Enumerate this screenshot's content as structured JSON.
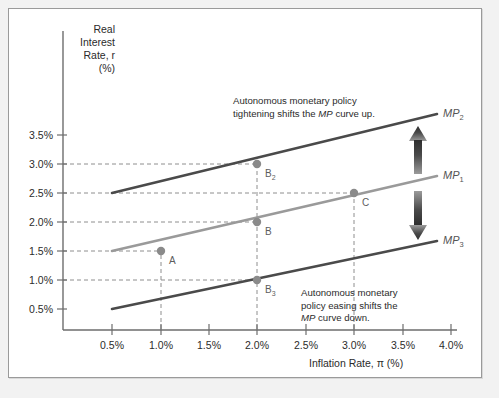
{
  "figure": {
    "y_axis_title": "Real\nInterest\nRate, r\n(%)",
    "x_axis_title": "Inflation Rate, π (%)"
  },
  "annotations": {
    "tighten": "Autonomous monetary policy\ntightening shifts the MP curve up.",
    "ease": "Autonomous monetary\npolicy easing shifts the\nMP curve down."
  },
  "curve_labels": {
    "mp2": "MP",
    "mp2_sub": "2",
    "mp1": "MP",
    "mp1_sub": "1",
    "mp3": "MP",
    "mp3_sub": "3"
  },
  "point_labels": {
    "a": "A",
    "b": "B",
    "b2": "B",
    "b2_sub": "2",
    "b3": "B",
    "b3_sub": "3",
    "c": "C"
  },
  "colors": {
    "mp1": "#9a9a9a",
    "mp2": "#4a4a4a",
    "mp3": "#4a4a4a",
    "axis": "#6d6d6d",
    "grid": "#8e8e8e",
    "marker": "#8a8a8a",
    "arrow": "#3a3a3a",
    "frame": "#9a9a9a",
    "page_background": "#f2f2f2",
    "plot_background": "#ffffff"
  },
  "chart_data": {
    "type": "line",
    "title": "",
    "xlabel": "Inflation Rate, π (%)",
    "ylabel": "Real Interest Rate, r (%)",
    "xlim": [
      0.25,
      4.25
    ],
    "ylim": [
      0.1,
      3.9
    ],
    "grid": "dashed horizontal and vertical guide lines to labeled points",
    "legend": "inline curve labels at right end of each line",
    "x_ticks": [
      "0.5%",
      "1.0%",
      "1.5%",
      "2.0%",
      "2.5%",
      "3.0%",
      "3.5%",
      "4.0%"
    ],
    "x_tick_values": [
      0.5,
      1.0,
      1.5,
      2.0,
      2.5,
      3.0,
      3.5,
      4.0
    ],
    "y_ticks": [
      "0.5%",
      "1.0%",
      "1.5%",
      "2.0%",
      "2.5%",
      "3.0%",
      "3.5%"
    ],
    "y_tick_values": [
      0.5,
      1.0,
      1.5,
      2.0,
      2.5,
      3.0,
      3.5
    ],
    "series": [
      {
        "name": "MP2",
        "label": "MP₂",
        "color": "#4a4a4a",
        "description": "Monetary policy curve after autonomous tightening (shifted up)",
        "x": [
          0.5,
          3.8
        ],
        "y": [
          2.25,
          3.85
        ]
      },
      {
        "name": "MP1",
        "label": "MP₁",
        "color": "#9a9a9a",
        "description": "Original monetary policy curve",
        "x": [
          0.5,
          3.8
        ],
        "y": [
          1.25,
          2.85
        ]
      },
      {
        "name": "MP3",
        "label": "MP₃",
        "color": "#4a4a4a",
        "description": "Monetary policy curve after autonomous easing (shifted down)",
        "x": [
          0.5,
          3.8
        ],
        "y": [
          0.25,
          1.75
        ]
      }
    ],
    "points": [
      {
        "label": "A",
        "x": 1.0,
        "y": 1.5,
        "on_curve": "MP1"
      },
      {
        "label": "B",
        "x": 2.0,
        "y": 2.0,
        "on_curve": "MP1"
      },
      {
        "label": "B2",
        "x": 2.0,
        "y": 3.0,
        "on_curve": "MP2"
      },
      {
        "label": "B3",
        "x": 2.0,
        "y": 1.0,
        "on_curve": "MP3"
      },
      {
        "label": "C",
        "x": 3.0,
        "y": 2.5,
        "on_curve": "MP1"
      }
    ],
    "annotations": [
      {
        "text": "Autonomous monetary policy tightening shifts the MP curve up.",
        "position": "upper-center"
      },
      {
        "text": "Autonomous monetary policy easing shifts the MP curve down.",
        "position": "lower-right"
      },
      {
        "text": "double-headed vertical arrow indicating upward and downward shift",
        "position": "right-center"
      }
    ]
  }
}
